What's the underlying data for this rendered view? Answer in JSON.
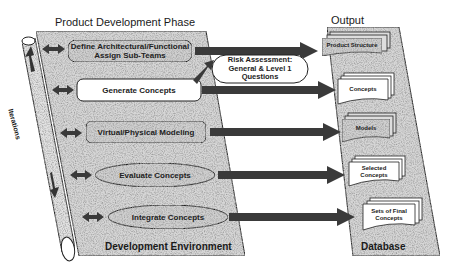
{
  "titles": {
    "phase": "Product Development Phase",
    "output": "Output",
    "environment": "Development Environment",
    "database": "Database",
    "iterations": "Iterations"
  },
  "activities": [
    {
      "id": "define",
      "label_line1": "Define Architectural/Functional",
      "label_line2": "Assign Sub-Teams",
      "shape": "rounded-rect"
    },
    {
      "id": "generate",
      "label": "Generate Concepts",
      "shape": "rounded-rect-white"
    },
    {
      "id": "modeling",
      "label": "Virtual/Physical Modeling",
      "shape": "rounded-rect"
    },
    {
      "id": "evaluate",
      "label": "Evaluate Concepts",
      "shape": "ellipse"
    },
    {
      "id": "integrate",
      "label": "Integrate Concepts",
      "shape": "ellipse"
    }
  ],
  "risk": {
    "line1": "Risk Assessment:",
    "line2": "General & Level 1",
    "line3": "Questions"
  },
  "outputs": [
    {
      "id": "product-structure",
      "label": "Product Structure"
    },
    {
      "id": "concepts",
      "label": "Concepts"
    },
    {
      "id": "models",
      "label": "Models"
    },
    {
      "id": "selected-concepts",
      "label_line1": "Selected",
      "label_line2": "Concepts"
    },
    {
      "id": "final-concepts",
      "label_line1": "Sets of Final",
      "label_line2": "Concepts"
    }
  ],
  "colors": {
    "speckle_bg": "#d4d4d4",
    "arrow": "#3a3a3a",
    "stroke": "#222222",
    "box_white": "#ffffff"
  }
}
